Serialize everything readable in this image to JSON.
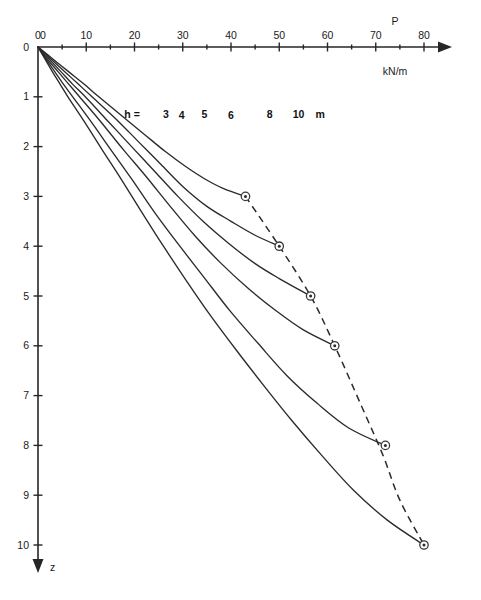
{
  "chart_data": {
    "type": "line",
    "title": "",
    "subtitle": "",
    "xlabel": "P",
    "xunit": "kN/m",
    "ylabel": "z",
    "yunit": "m",
    "xlim": [
      0,
      80
    ],
    "ylim": [
      0,
      10
    ],
    "x_axis_position": "top",
    "y_axis_direction": "down",
    "grid": false,
    "legend_position": "inline-on-curves",
    "legend_prefix": "h =",
    "legend_unit": "m",
    "x_ticks": [
      0,
      10,
      20,
      30,
      40,
      50,
      60,
      70,
      80
    ],
    "x_tick_labels": [
      "0",
      "10",
      "20",
      "30",
      "40",
      "50",
      "60",
      "70",
      "80"
    ],
    "x_minor_ticks": [
      5,
      15,
      25,
      35,
      45,
      55,
      65,
      75
    ],
    "y_ticks": [
      0,
      1,
      2,
      3,
      4,
      5,
      6,
      7,
      8,
      9,
      10
    ],
    "y_tick_labels": [
      "0",
      "1",
      "2",
      "3",
      "4",
      "5",
      "6",
      "7",
      "8",
      "9",
      "10"
    ],
    "y_origin_label": "0",
    "series": [
      {
        "name": "3",
        "label": "h = 3 m",
        "h": 3,
        "endpoint": {
          "P": 43.0,
          "z": 3.0
        },
        "points": [
          [
            0,
            0
          ],
          [
            3.2,
            0.25
          ],
          [
            6.4,
            0.5
          ],
          [
            9.6,
            0.75
          ],
          [
            12.6,
            1.0
          ],
          [
            17.6,
            1.4
          ],
          [
            22.0,
            1.75
          ],
          [
            26.4,
            2.1
          ],
          [
            30.6,
            2.4
          ],
          [
            34.6,
            2.65
          ],
          [
            38.6,
            2.85
          ],
          [
            43.0,
            3.0
          ]
        ]
      },
      {
        "name": "4",
        "label": "h = 4 m",
        "h": 4,
        "endpoint": {
          "P": 50.0,
          "z": 4.0
        },
        "points": [
          [
            0,
            0
          ],
          [
            2.8,
            0.25
          ],
          [
            5.6,
            0.5
          ],
          [
            8.4,
            0.75
          ],
          [
            11.2,
            1.0
          ],
          [
            16.2,
            1.45
          ],
          [
            20.8,
            1.9
          ],
          [
            25.4,
            2.35
          ],
          [
            30.0,
            2.8
          ],
          [
            35.0,
            3.2
          ],
          [
            40.0,
            3.5
          ],
          [
            45.0,
            3.78
          ],
          [
            50.0,
            4.0
          ]
        ]
      },
      {
        "name": "5",
        "label": "h = 5 m",
        "h": 5,
        "endpoint": {
          "P": 56.5,
          "z": 5.0
        },
        "points": [
          [
            0,
            0
          ],
          [
            2.4,
            0.25
          ],
          [
            4.8,
            0.5
          ],
          [
            7.2,
            0.75
          ],
          [
            9.8,
            1.0
          ],
          [
            14.6,
            1.5
          ],
          [
            19.4,
            2.0
          ],
          [
            24.2,
            2.5
          ],
          [
            29.0,
            3.0
          ],
          [
            34.2,
            3.5
          ],
          [
            39.6,
            3.95
          ],
          [
            45.0,
            4.35
          ],
          [
            50.0,
            4.65
          ],
          [
            56.5,
            5.0
          ]
        ]
      },
      {
        "name": "6",
        "label": "h = 6 m",
        "h": 6,
        "endpoint": {
          "P": 61.5,
          "z": 6.0
        },
        "points": [
          [
            0,
            0
          ],
          [
            2.0,
            0.25
          ],
          [
            4.2,
            0.5
          ],
          [
            6.4,
            0.75
          ],
          [
            8.6,
            1.0
          ],
          [
            13.0,
            1.5
          ],
          [
            17.6,
            2.05
          ],
          [
            22.4,
            2.6
          ],
          [
            27.4,
            3.2
          ],
          [
            32.6,
            3.8
          ],
          [
            38.0,
            4.35
          ],
          [
            43.6,
            4.85
          ],
          [
            49.4,
            5.3
          ],
          [
            55.0,
            5.68
          ],
          [
            61.5,
            6.0
          ]
        ]
      },
      {
        "name": "8",
        "label": "h = 8 m",
        "h": 8,
        "endpoint": {
          "P": 72.0,
          "z": 8.0
        },
        "points": [
          [
            0,
            0
          ],
          [
            1.7,
            0.25
          ],
          [
            3.5,
            0.5
          ],
          [
            5.3,
            0.75
          ],
          [
            7.2,
            1.0
          ],
          [
            11.0,
            1.5
          ],
          [
            15.0,
            2.05
          ],
          [
            19.4,
            2.65
          ],
          [
            24.0,
            3.3
          ],
          [
            29.0,
            3.95
          ],
          [
            34.2,
            4.6
          ],
          [
            39.8,
            5.3
          ],
          [
            45.6,
            5.95
          ],
          [
            51.6,
            6.6
          ],
          [
            57.8,
            7.15
          ],
          [
            64.4,
            7.65
          ],
          [
            72.0,
            8.0
          ]
        ]
      },
      {
        "name": "10",
        "label": "h = 10 m",
        "h": 10,
        "endpoint": {
          "P": 80.0,
          "z": 10.0
        },
        "points": [
          [
            0,
            0
          ],
          [
            1.5,
            0.25
          ],
          [
            3.0,
            0.5
          ],
          [
            4.6,
            0.75
          ],
          [
            6.2,
            1.0
          ],
          [
            9.6,
            1.5
          ],
          [
            13.2,
            2.05
          ],
          [
            17.2,
            2.65
          ],
          [
            21.4,
            3.3
          ],
          [
            26.0,
            4.0
          ],
          [
            30.8,
            4.7
          ],
          [
            35.8,
            5.4
          ],
          [
            41.2,
            6.1
          ],
          [
            46.8,
            6.8
          ],
          [
            52.6,
            7.5
          ],
          [
            58.8,
            8.2
          ],
          [
            65.4,
            8.9
          ],
          [
            72.4,
            9.5
          ],
          [
            80.0,
            10.0
          ]
        ]
      }
    ],
    "envelope": {
      "name": "endpoint-envelope",
      "style": "dashed",
      "points": [
        [
          43.0,
          3.0
        ],
        [
          50.0,
          4.0
        ],
        [
          56.5,
          5.0
        ],
        [
          61.5,
          6.0
        ],
        [
          67.0,
          7.2
        ],
        [
          71.5,
          8.2
        ],
        [
          75.0,
          9.1
        ],
        [
          80.0,
          10.0
        ]
      ]
    },
    "markers": [
      {
        "P": 43.0,
        "z": 3.0,
        "series": "3"
      },
      {
        "P": 50.0,
        "z": 4.0,
        "series": "4"
      },
      {
        "P": 56.5,
        "z": 5.0,
        "series": "5"
      },
      {
        "P": 61.5,
        "z": 6.0,
        "series": "6"
      },
      {
        "P": 72.0,
        "z": 8.0,
        "series": "8"
      },
      {
        "P": 80.0,
        "z": 10.0,
        "series": "10"
      }
    ],
    "curve_labels": [
      {
        "text": "h =",
        "P": 19.5,
        "z": 1.42,
        "bold": true
      },
      {
        "text": "3",
        "P": 26.5,
        "z": 1.42,
        "bold": true
      },
      {
        "text": "4",
        "P": 29.8,
        "z": 1.45,
        "bold": true
      },
      {
        "text": "5",
        "P": 34.5,
        "z": 1.42,
        "bold": true
      },
      {
        "text": "6",
        "P": 40.0,
        "z": 1.45,
        "bold": true
      },
      {
        "text": "8",
        "P": 48.0,
        "z": 1.42,
        "bold": true
      },
      {
        "text": "10",
        "P": 54.0,
        "z": 1.42,
        "bold": true
      },
      {
        "text": "m",
        "P": 58.5,
        "z": 1.42,
        "bold": true
      }
    ]
  },
  "labels": {
    "x_axis_name": "P",
    "x_axis_unit": "kN/m",
    "y_axis_name": "z"
  }
}
